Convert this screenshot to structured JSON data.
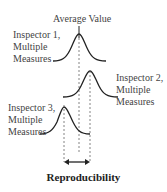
{
  "diagram": {
    "title": "Reproducibility",
    "top_label": "Average Value",
    "curves": [
      {
        "label_line1": "Inspector 1,",
        "label_line2": "Multiple",
        "label_line3": "Measures"
      },
      {
        "label_line1": "Inspector 2,",
        "label_line2": "Multiple",
        "label_line3": "Measures"
      },
      {
        "label_line1": "Inspector 3,",
        "label_line2": "Multiple",
        "label_line3": "Measures"
      }
    ],
    "colors": {
      "line": "#222222",
      "dashed": "#666666",
      "text": "#444444"
    }
  }
}
